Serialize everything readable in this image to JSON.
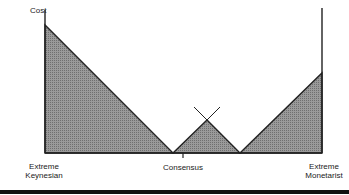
{
  "diagram": {
    "y_axis_label": "Cost",
    "x_labels": {
      "left_line1": "Extreme",
      "left_line2": "Keynesian",
      "center": "Consensus",
      "right_line1": "Extreme",
      "right_line2": "Monetarist"
    },
    "colors": {
      "fill": "#8a8a8a",
      "line": "#222222",
      "background": "#ffffff"
    },
    "shapes": [
      {
        "name": "left-cost-triangle",
        "points": "45,25 45,153 173,153"
      },
      {
        "name": "center-cost-triangle",
        "points": "173,153 207,120 240,153"
      },
      {
        "name": "right-cost-triangle",
        "points": "240,153 322,73 322,153"
      }
    ]
  }
}
